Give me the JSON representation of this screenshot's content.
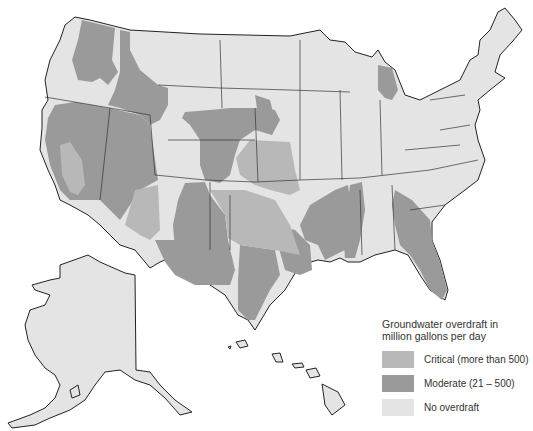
{
  "map": {
    "title": "Groundwater overdraft in million gallons per day",
    "regions": [
      "Contiguous United States",
      "Alaska",
      "Hawaii"
    ],
    "colors": {
      "critical": "#b8b8b8",
      "moderate": "#9a9a9a",
      "no_overdraft": "#e4e4e4",
      "border": "#333333"
    }
  },
  "legend": {
    "title_line1": "Groundwater overdraft in",
    "title_line2": "million gallons per day",
    "items": [
      {
        "key": "critical",
        "label": "Critical (more than 500)",
        "color": "#b8b8b8"
      },
      {
        "key": "moderate",
        "label": "Moderate (21 – 500)",
        "color": "#9a9a9a"
      },
      {
        "key": "none",
        "label": "No overdraft",
        "color": "#e4e4e4"
      }
    ]
  }
}
